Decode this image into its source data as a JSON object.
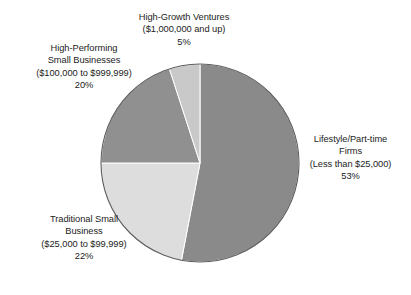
{
  "chart_data": {
    "type": "pie",
    "title": "",
    "subtitle": "",
    "xlabel": "",
    "ylabel": "",
    "legend_position": "none",
    "grid": false,
    "categories": [
      "Lifestyle/Part-time Firms (Less than $25,000)",
      "Traditional Small Business ($25,000 to $99,999)",
      "High-Performing Small Businesses ($100,000 to $999,999)",
      "High-Growth Ventures ($1,000,000 and up)"
    ],
    "values": [
      53,
      22,
      20,
      5
    ],
    "value_unit": "%",
    "slices": [
      {
        "name": "Lifestyle/Part-time Firms",
        "range": "(Less than $25,000)",
        "value": 53,
        "percent_label": "53%",
        "color": "#8a8a8a",
        "start_angle": 0,
        "end_angle": 190.8
      },
      {
        "name": "Traditional Small Business",
        "range": "($25,000 to $99,999)",
        "value": 22,
        "percent_label": "22%",
        "color": "#dddddd",
        "start_angle": 190.8,
        "end_angle": 270.0
      },
      {
        "name": "High-Performing Small Businesses",
        "range": "($100,000 to $999,999)",
        "value": 20,
        "percent_label": "20%",
        "color": "#909090",
        "start_angle": 270.0,
        "end_angle": 342.0
      },
      {
        "name": "High-Growth Ventures",
        "range": "($1,000,000 and up)",
        "value": 5,
        "percent_label": "5%",
        "color": "#c9c9c9",
        "start_angle": 342.0,
        "end_angle": 360.0
      }
    ]
  },
  "labels": {
    "high_growth": {
      "line1": "High-Growth Ventures",
      "line2": "($1,000,000 and up)",
      "line3": "5%"
    },
    "high_performing": {
      "line1": "High-Performing",
      "line2": "Small Businesses",
      "line3": "($100,000 to $999,999)",
      "line4": "20%"
    },
    "traditional": {
      "line1": "Traditional Small",
      "line2": "Business",
      "line3": "($25,000 to $99,999)",
      "line4": "22%"
    },
    "lifestyle": {
      "line1": "Lifestyle/Part-time",
      "line2": "Firms",
      "line3": "(Less than $25,000)",
      "line4": "53%"
    }
  },
  "style": {
    "background": "#ffffff",
    "text_color": "#1c1c1c",
    "outline_color": "#5a5a5a"
  }
}
